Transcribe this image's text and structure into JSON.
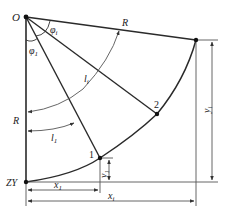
{
  "diagram": {
    "labels": {
      "origin": "O",
      "start_point": "ZY",
      "radius_top": "R",
      "radius_left": "R",
      "phi_i": "φ",
      "phi_i_sub": "i",
      "phi_1": "φ",
      "phi_1_sub": "1",
      "arc_li": "l",
      "arc_li_sub": "i",
      "arc_l1": "l",
      "arc_l1_sub": "1",
      "point_1": "1",
      "point_2": "2",
      "x1": "x",
      "x1_sub": "1",
      "xi": "x",
      "xi_sub": "i",
      "y1": "y",
      "y1_sub": "1",
      "yi": "y",
      "yi_sub": "i"
    },
    "colors": {
      "line": "#2a2a2a",
      "dim": "#555555",
      "point": "#111111"
    }
  }
}
